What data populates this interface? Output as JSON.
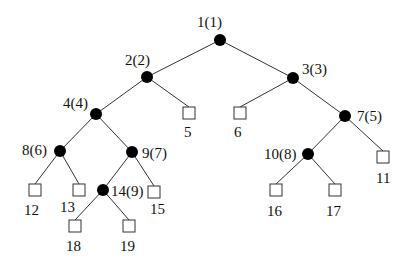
{
  "diagram": {
    "type": "binary-tree",
    "nodes": [
      {
        "id": "1",
        "label": "1(1)",
        "kind": "internal",
        "x": 220,
        "y": 40,
        "lx": 197,
        "ly": 27,
        "anchor": "start"
      },
      {
        "id": "2",
        "label": "2(2)",
        "kind": "internal",
        "x": 147,
        "y": 77,
        "lx": 125,
        "ly": 65,
        "anchor": "start"
      },
      {
        "id": "3",
        "label": "3(3)",
        "kind": "internal",
        "x": 293,
        "y": 78,
        "lx": 302,
        "ly": 74,
        "anchor": "start"
      },
      {
        "id": "4",
        "label": "4(4)",
        "kind": "internal",
        "x": 96,
        "y": 114,
        "lx": 63,
        "ly": 108,
        "anchor": "start"
      },
      {
        "id": "5",
        "label": "5",
        "kind": "leaf",
        "x": 189,
        "y": 113,
        "lx": 184,
        "ly": 137,
        "anchor": "start"
      },
      {
        "id": "6",
        "label": "6",
        "kind": "leaf",
        "x": 240,
        "y": 113,
        "lx": 234,
        "ly": 137,
        "anchor": "start"
      },
      {
        "id": "7",
        "label": "7(5)",
        "kind": "internal",
        "x": 345,
        "y": 116,
        "lx": 357,
        "ly": 121,
        "anchor": "start"
      },
      {
        "id": "8",
        "label": "8(6)",
        "kind": "internal",
        "x": 60,
        "y": 151,
        "lx": 22,
        "ly": 155,
        "anchor": "start"
      },
      {
        "id": "9",
        "label": "9(7)",
        "kind": "internal",
        "x": 132,
        "y": 152,
        "lx": 142,
        "ly": 158,
        "anchor": "start"
      },
      {
        "id": "10",
        "label": "10(8)",
        "kind": "internal",
        "x": 308,
        "y": 154,
        "lx": 264,
        "ly": 159,
        "anchor": "start"
      },
      {
        "id": "11",
        "label": "11",
        "kind": "leaf",
        "x": 383,
        "y": 157,
        "lx": 376,
        "ly": 183,
        "anchor": "start"
      },
      {
        "id": "12",
        "label": "12",
        "kind": "leaf",
        "x": 35,
        "y": 190,
        "lx": 24,
        "ly": 215,
        "anchor": "start"
      },
      {
        "id": "13",
        "label": "13",
        "kind": "leaf",
        "x": 79,
        "y": 190,
        "lx": 60,
        "ly": 212,
        "anchor": "start"
      },
      {
        "id": "14",
        "label": "14(9)",
        "kind": "internal",
        "x": 103,
        "y": 190,
        "lx": 111,
        "ly": 196,
        "anchor": "start"
      },
      {
        "id": "15",
        "label": "15",
        "kind": "leaf",
        "x": 154,
        "y": 192,
        "lx": 150,
        "ly": 214,
        "anchor": "start"
      },
      {
        "id": "16",
        "label": "16",
        "kind": "leaf",
        "x": 276,
        "y": 190,
        "lx": 267,
        "ly": 216,
        "anchor": "start"
      },
      {
        "id": "17",
        "label": "17",
        "kind": "leaf",
        "x": 335,
        "y": 190,
        "lx": 326,
        "ly": 216,
        "anchor": "start"
      },
      {
        "id": "18",
        "label": "18",
        "kind": "leaf",
        "x": 75,
        "y": 226,
        "lx": 66,
        "ly": 251,
        "anchor": "start"
      },
      {
        "id": "19",
        "label": "19",
        "kind": "leaf",
        "x": 129,
        "y": 226,
        "lx": 120,
        "ly": 251,
        "anchor": "start"
      }
    ],
    "edges": [
      [
        "1",
        "2"
      ],
      [
        "1",
        "3"
      ],
      [
        "2",
        "4"
      ],
      [
        "2",
        "5"
      ],
      [
        "3",
        "6"
      ],
      [
        "3",
        "7"
      ],
      [
        "4",
        "8"
      ],
      [
        "4",
        "9"
      ],
      [
        "7",
        "10"
      ],
      [
        "7",
        "11"
      ],
      [
        "8",
        "12"
      ],
      [
        "8",
        "13"
      ],
      [
        "9",
        "14"
      ],
      [
        "9",
        "15"
      ],
      [
        "10",
        "16"
      ],
      [
        "10",
        "17"
      ],
      [
        "14",
        "18"
      ],
      [
        "14",
        "19"
      ]
    ]
  }
}
